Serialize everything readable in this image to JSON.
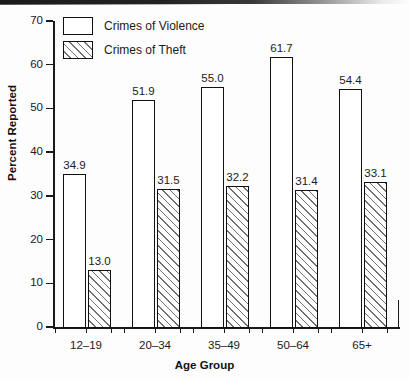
{
  "chart_data": {
    "type": "bar",
    "title": "",
    "subtitle": "",
    "xlabel": "Age Group",
    "ylabel": "Percent Reported",
    "categories": [
      "12–19",
      "20–34",
      "35–49",
      "50–64",
      "65+"
    ],
    "series": [
      {
        "name": "Crimes of Violence",
        "style": "open",
        "values": [
          34.9,
          51.9,
          55.0,
          61.7,
          54.4
        ],
        "labels": [
          "34.9",
          "51.9",
          "55.0",
          "61.7",
          "54.4"
        ]
      },
      {
        "name": "Crimes of Theft",
        "style": "hatched",
        "values": [
          13.0,
          31.5,
          32.2,
          31.4,
          33.1
        ],
        "labels": [
          "13.0",
          "31.5",
          "32.2",
          "31.4",
          "33.1"
        ]
      }
    ],
    "ylim": [
      0,
      70
    ],
    "yticks": [
      0,
      10,
      20,
      30,
      40,
      50,
      60,
      70
    ],
    "ytick_labels": [
      "0",
      "10",
      "20",
      "30",
      "40",
      "50",
      "60",
      "70"
    ],
    "grid": false,
    "legend_position": "top-left",
    "colors": {
      "axis": "#1a1a1a",
      "bar_outline": "#111111",
      "bar_fill": "#ffffff",
      "hatch": "#6f6f6f",
      "background": "#fdfdfd"
    }
  },
  "legend": {
    "entries": [
      {
        "label": "Crimes of Violence",
        "style": "open"
      },
      {
        "label": "Crimes of Theft",
        "style": "hatched"
      }
    ]
  }
}
